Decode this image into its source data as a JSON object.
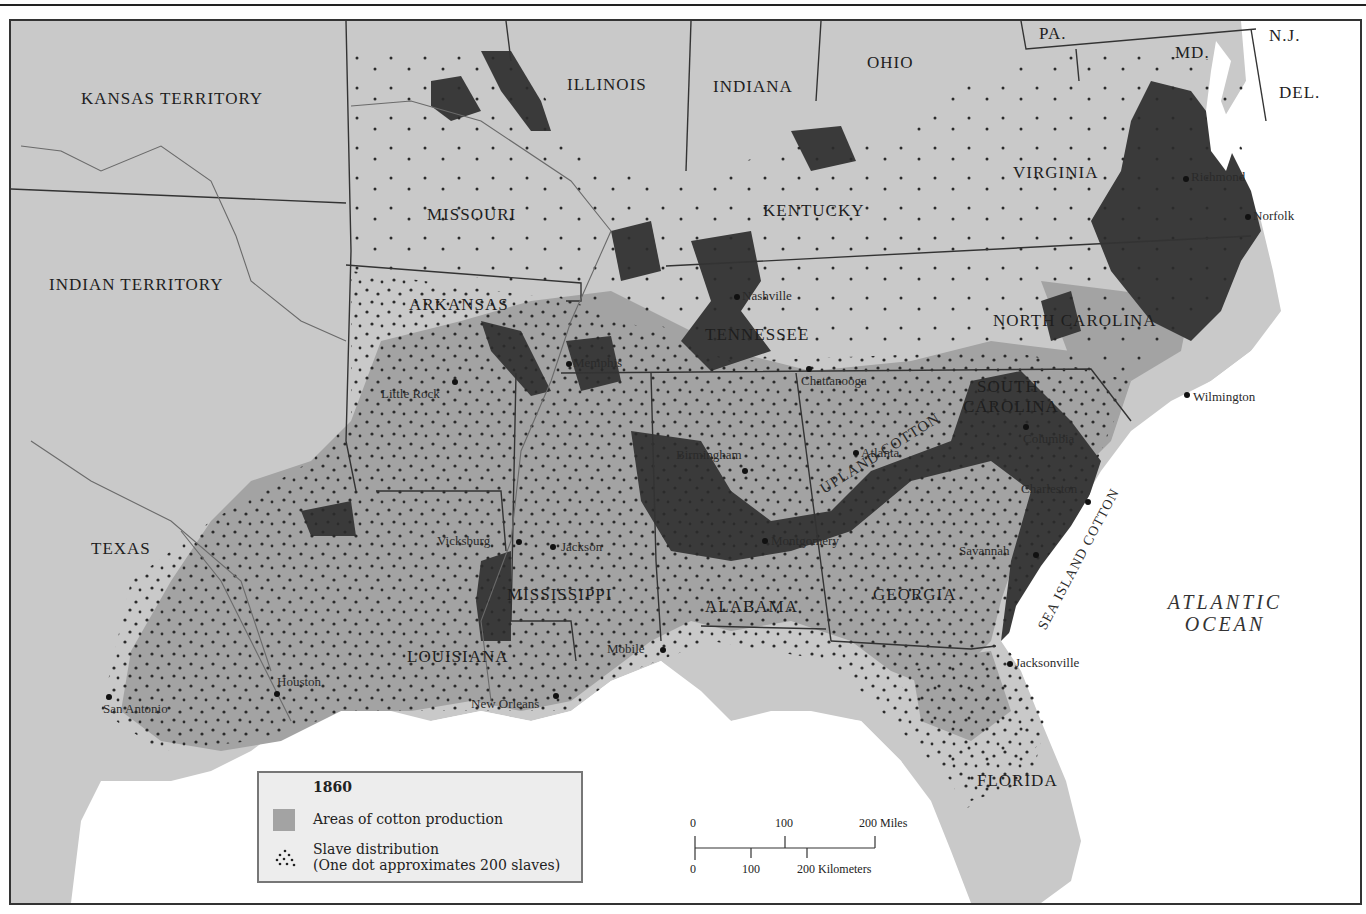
{
  "map": {
    "title": "1860",
    "colors": {
      "land": "#c9c9c9",
      "cotton": "#a3a3a3",
      "dense_slave": "#3a3a3a",
      "water": "#ffffff",
      "border": "#333333",
      "dot": "#2b2b2b"
    },
    "territories": [
      {
        "name": "KANSAS TERRITORY"
      },
      {
        "name": "INDIAN TERRITORY"
      }
    ],
    "states": [
      {
        "name": "ILLINOIS"
      },
      {
        "name": "INDIANA"
      },
      {
        "name": "OHIO"
      },
      {
        "name": "PA."
      },
      {
        "name": "MD."
      },
      {
        "name": "N.J."
      },
      {
        "name": "DEL."
      },
      {
        "name": "MISSOURI"
      },
      {
        "name": "KENTUCKY"
      },
      {
        "name": "VIRGINIA"
      },
      {
        "name": "ARKANSAS"
      },
      {
        "name": "TENNESSEE"
      },
      {
        "name": "NORTH CAROLINA"
      },
      {
        "name": "SOUTH"
      },
      {
        "name": "CAROLINA"
      },
      {
        "name": "TEXAS"
      },
      {
        "name": "MISSISSIPPI"
      },
      {
        "name": "ALABAMA"
      },
      {
        "name": "GEORGIA"
      },
      {
        "name": "LOUISIANA"
      },
      {
        "name": "FLORIDA"
      }
    ],
    "cities": [
      {
        "name": "Richmond"
      },
      {
        "name": "Norfolk"
      },
      {
        "name": "Nashville"
      },
      {
        "name": "Memphis"
      },
      {
        "name": "Chattanooga"
      },
      {
        "name": "Wilmington"
      },
      {
        "name": "Little Rock"
      },
      {
        "name": "Columbia"
      },
      {
        "name": "Atlanta"
      },
      {
        "name": "Birmingham"
      },
      {
        "name": "Charleston"
      },
      {
        "name": "Vicksburg"
      },
      {
        "name": "Jackson"
      },
      {
        "name": "Montgomery"
      },
      {
        "name": "Savannah"
      },
      {
        "name": "Mobile"
      },
      {
        "name": "Jacksonville"
      },
      {
        "name": "Houston"
      },
      {
        "name": "San Antonio"
      },
      {
        "name": "New Orleans"
      }
    ],
    "annotations": {
      "upland": "UPLAND COTTON",
      "sea_island": "SEA ISLAND COTTON",
      "ocean_line1": "ATLANTIC",
      "ocean_line2": "OCEAN"
    }
  },
  "legend": {
    "year": "1860",
    "items": [
      {
        "label": "Areas of cotton production",
        "symbol": "gray-swatch"
      },
      {
        "label": "Slave distribution",
        "sublabel": "(One dot approximates 200 slaves)",
        "symbol": "dot-cluster"
      }
    ]
  },
  "scale_bar": {
    "miles": {
      "ticks": [
        "0",
        "100",
        "200 Miles"
      ]
    },
    "kilometers": {
      "ticks": [
        "0",
        "100",
        "200 Kilometers"
      ]
    }
  }
}
